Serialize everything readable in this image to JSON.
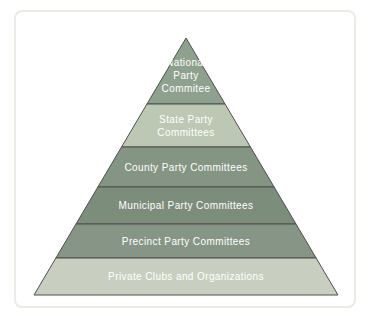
{
  "figure": {
    "background_color": "#ffffff",
    "frame_color": "#ebebe8"
  },
  "chart_data": {
    "type": "pyramid",
    "title": "",
    "direction": "top-to-bottom",
    "levels": [
      {
        "label": "National Party Commitee",
        "lines": [
          "National",
          "Party",
          "Commitee"
        ],
        "color": "#8ea08e"
      },
      {
        "label": "State Party Committees",
        "lines": [
          "State Party",
          "Committees"
        ],
        "color": "#bcc7b4"
      },
      {
        "label": "County Party Committees",
        "lines": [
          "County Party Committees"
        ],
        "color": "#859584"
      },
      {
        "label": "Municipal Party Committees",
        "lines": [
          "Municipal Party Committees"
        ],
        "color": "#7d8d7c"
      },
      {
        "label": "Precinct Party Committees",
        "lines": [
          "Precinct Party Committees"
        ],
        "color": "#869586"
      },
      {
        "label": "Private Clubs and Organizations",
        "lines": [
          "Private Clubs and Organizations"
        ],
        "color": "#c8cfc0"
      }
    ],
    "text_color": "#ffffff",
    "outline_color": "#4f4f4f"
  }
}
